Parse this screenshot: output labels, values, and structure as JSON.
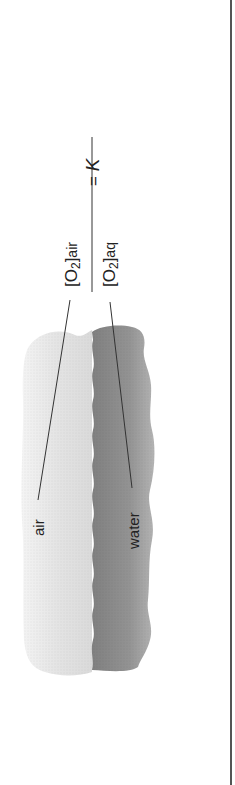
{
  "diagram": {
    "labels": {
      "air": "air",
      "water": "water"
    },
    "equation": {
      "numerator_species": "[O",
      "numerator_subscript": "2",
      "numerator_bracket": "]",
      "numerator_phase": "air",
      "denominator_species": "[O",
      "denominator_subscript": "2",
      "denominator_bracket": "]",
      "denominator_phase": "aq",
      "equals": "=",
      "constant": "K"
    },
    "colors": {
      "air_band": "#e2e2e2",
      "water_band": "#8e8e8e",
      "leader_line": "#333333",
      "rule": "#555555"
    }
  }
}
